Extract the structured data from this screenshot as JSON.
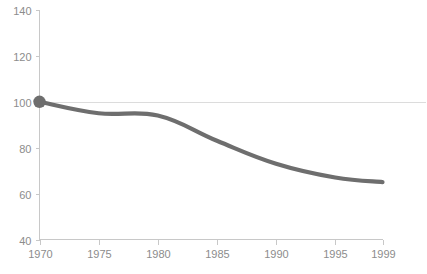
{
  "chart_data": {
    "type": "line",
    "title": "",
    "subtitle": "",
    "xlabel": "",
    "ylabel": "",
    "x": [
      1970,
      1975,
      1980,
      1985,
      1990,
      1995,
      1999
    ],
    "series": [
      {
        "name": "index",
        "values": [
          100,
          95,
          94,
          83,
          73,
          67,
          65
        ]
      }
    ],
    "xlim": [
      1970,
      1999
    ],
    "ylim": [
      40,
      140
    ],
    "x_ticks": [
      1970,
      1975,
      1980,
      1985,
      1990,
      1995,
      1999
    ],
    "x_tick_labels": [
      "1970",
      "1975",
      "1980",
      "1985",
      "1990",
      "1995",
      "1999"
    ],
    "y_ticks": [
      40,
      60,
      80,
      100,
      120,
      140
    ],
    "y_tick_labels": [
      "40",
      "60",
      "80",
      "100",
      "120",
      "140"
    ],
    "grid": "horizontal-at-100-only",
    "gridlines_y": [
      100
    ],
    "legend": "none",
    "legend_position": "none",
    "annotations": [],
    "markers": [
      {
        "x": 1970,
        "y": 100,
        "shape": "circle"
      }
    ],
    "colors": {
      "line": "#6e6e6e",
      "marker": "#6e6e6e",
      "axis": "#c8c8c8",
      "gridline": "#dcdcdc",
      "tick_text": "#8c8c8c",
      "background": "#ffffff"
    }
  }
}
